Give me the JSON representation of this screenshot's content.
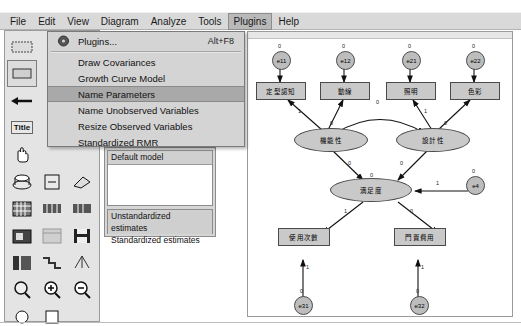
{
  "menubar": {
    "items": [
      {
        "label": "File",
        "active": false
      },
      {
        "label": "Edit",
        "active": false
      },
      {
        "label": "View",
        "active": false
      },
      {
        "label": "Diagram",
        "active": false
      },
      {
        "label": "Analyze",
        "active": false
      },
      {
        "label": "Tools",
        "active": false
      },
      {
        "label": "Plugins",
        "active": true
      },
      {
        "label": "Help",
        "active": false
      }
    ]
  },
  "dropdown": {
    "items": [
      {
        "label": "Plugins...",
        "accel": "Alt+F8",
        "selected": false,
        "bullet": true
      },
      {
        "label": "Draw Covariances",
        "accel": "",
        "selected": false,
        "bullet": false
      },
      {
        "label": "Growth Curve Model",
        "accel": "",
        "selected": false,
        "bullet": false
      },
      {
        "label": "Name Parameters",
        "accel": "",
        "selected": true,
        "bullet": false
      },
      {
        "label": "Name Unobserved Variables",
        "accel": "",
        "selected": false,
        "bullet": false
      },
      {
        "label": "Resize Observed Variables",
        "accel": "",
        "selected": false,
        "bullet": false
      },
      {
        "label": "Standardized RMR",
        "accel": "",
        "selected": false,
        "bullet": false
      }
    ]
  },
  "toolbar": {
    "title_button_label": "Title",
    "icons": [
      "rectangle-tool-icon",
      "ellipse-tool-icon",
      "three-indicators-icon",
      "single-arrow-icon",
      "double-arrow-icon",
      "error-variable-icon",
      "title-text-icon",
      "list-variables-dataset-icon",
      "list-variables-model-icon",
      "hand-select-icon",
      "select-all-icon",
      "deselect-all-icon",
      "duplicate-object-icon",
      "move-object-icon",
      "erase-object-icon",
      "move-parameter-icon",
      "reflect-indicators-icon",
      "rotate-indicators-icon",
      "shape-change-icon",
      "touch-up-icon",
      "magic-wand-icon",
      "data-file-icon",
      "analysis-properties-icon",
      "calculate-estimates-icon",
      "clipboard-copy-icon",
      "text-output-icon",
      "save-diagram-icon",
      "object-properties-icon",
      "drag-properties-icon",
      "preserve-symmetries-icon",
      "loupe-icon",
      "zoom-in-icon",
      "zoom-out-icon"
    ]
  },
  "model_panel": {
    "model_list_header": "Default model",
    "estimate_options": [
      {
        "label": "Unstandardized estimates",
        "highlighted": true
      },
      {
        "label": "Standardized estimates",
        "highlighted": false
      }
    ]
  },
  "diagram": {
    "observed_top": [
      {
        "id": "obs-1",
        "label": "定型認知"
      },
      {
        "id": "obs-2",
        "label": "動線"
      },
      {
        "id": "obs-3",
        "label": "照明"
      },
      {
        "id": "obs-4",
        "label": "色彩"
      }
    ],
    "observed_bottom": [
      {
        "id": "obs-5",
        "label": "使用次數"
      },
      {
        "id": "obs-6",
        "label": "門置費用"
      }
    ],
    "errors_top": [
      {
        "id": "e11",
        "label": "e11",
        "param": "0"
      },
      {
        "id": "e12",
        "label": "e12",
        "param": "0"
      },
      {
        "id": "e21",
        "label": "e21",
        "param": "0"
      },
      {
        "id": "e22",
        "label": "e22",
        "param": "0"
      }
    ],
    "errors_bottom": [
      {
        "id": "e31",
        "label": "e31",
        "param": "0"
      },
      {
        "id": "e32",
        "label": "e32",
        "param": "0"
      }
    ],
    "error_endogenous": {
      "id": "e4",
      "label": "e4",
      "param": "0"
    },
    "latent": [
      {
        "id": "lat-1",
        "label": "機能性"
      },
      {
        "id": "lat-2",
        "label": "設計性"
      },
      {
        "id": "lat-3",
        "label": "満足度"
      }
    ],
    "path_labels": {
      "err_loading": "1",
      "factor_loading_fixed": "1",
      "factor_loading_free": "0",
      "structural": "0",
      "disturbance": "1",
      "covariance": "0"
    }
  },
  "colors": {
    "menu_background": "#d9d9d9",
    "menu_highlight": "#b9b9b9",
    "dropdown_background": "#d4d4d4",
    "dropdown_selected": "#a9a9a9",
    "toolbar_background": "#e4e4e4",
    "node_fill": "#c9c9c9",
    "error_fill": "#bdbdbd",
    "node_stroke": "#4a4a4a",
    "canvas": "#ffffff"
  }
}
